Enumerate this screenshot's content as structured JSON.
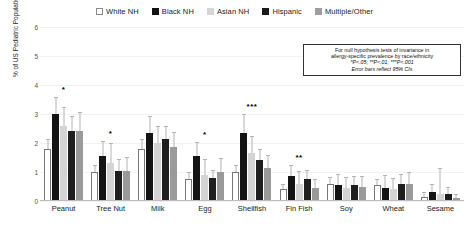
{
  "legend": {
    "position": "top-center",
    "items": [
      {
        "label": "White NH",
        "swatch": "white-swatch",
        "color": "#ffffff"
      },
      {
        "label": "Black NH",
        "swatch": "black-swatch",
        "color": "#141414"
      },
      {
        "label": "Asian NH",
        "swatch": "light-gray-swatch",
        "color": "#d4d4d4"
      },
      {
        "label": "Hispanic",
        "swatch": "dark-swatch",
        "color": "#1f1f1f"
      },
      {
        "label": "Multiple/Other",
        "swatch": "medium-gray-swatch",
        "color": "#9a9a9a"
      }
    ]
  },
  "axes": {
    "ylabel": "% of US Pediatric Population",
    "yticks": [
      "0",
      "1",
      "2",
      "3",
      "4",
      "5",
      "6"
    ]
  },
  "note": {
    "line1": "For null hypothesis tests of invariance in",
    "line2": "allergy-specific prevalence by race/ethnicity",
    "line3": "*P<.05; **P<.01; ***P<.001",
    "line4": "Error bars reflect 95% CIs"
  },
  "chart_data": {
    "type": "bar",
    "title": "",
    "xlabel": "",
    "ylabel": "% of US Pediatric Population",
    "ylim": [
      0,
      6
    ],
    "grid": true,
    "legend_position": "top-center",
    "categories": [
      "Peanut",
      "Tree Nut",
      "Milk",
      "Egg",
      "Shellfish",
      "Fin Fish",
      "Soy",
      "Wheat",
      "Sesame"
    ],
    "significance": [
      "*",
      "*",
      "",
      "*",
      "***",
      "**",
      "",
      "",
      ""
    ],
    "series": [
      {
        "name": "White NH",
        "color": "#ffffff",
        "values": [
          1.8,
          1.0,
          1.8,
          0.75,
          1.0,
          0.4,
          0.6,
          0.55,
          0.15
        ],
        "ci_low": [
          1.55,
          0.82,
          1.55,
          0.6,
          0.82,
          0.28,
          0.44,
          0.4,
          0.07
        ],
        "ci_high": [
          2.1,
          1.22,
          2.1,
          0.95,
          1.2,
          0.55,
          0.78,
          0.72,
          0.26
        ]
      },
      {
        "name": "Black NH",
        "color": "#141414",
        "values": [
          3.0,
          1.55,
          2.35,
          1.55,
          2.35,
          0.85,
          0.55,
          0.45,
          0.3
        ],
        "ci_low": [
          2.6,
          1.2,
          1.95,
          1.2,
          1.95,
          0.62,
          0.34,
          0.26,
          0.14
        ],
        "ci_high": [
          3.55,
          2.05,
          2.9,
          2.0,
          2.95,
          1.2,
          0.9,
          0.85,
          0.55
        ]
      },
      {
        "name": "Asian NH",
        "color": "#d4d4d4",
        "values": [
          2.6,
          1.3,
          2.0,
          0.9,
          1.65,
          0.6,
          0.45,
          0.4,
          0.25
        ],
        "ci_low": [
          2.15,
          0.95,
          1.6,
          0.62,
          1.28,
          0.38,
          0.25,
          0.2,
          0.1
        ],
        "ci_high": [
          3.2,
          1.95,
          2.55,
          1.4,
          2.2,
          1.0,
          0.8,
          0.75,
          1.1
        ]
      },
      {
        "name": "Hispanic",
        "color": "#1f1f1f",
        "values": [
          2.4,
          1.05,
          2.15,
          0.8,
          1.4,
          0.75,
          0.55,
          0.6,
          0.25
        ],
        "ci_low": [
          2.05,
          0.82,
          1.85,
          0.62,
          1.15,
          0.55,
          0.38,
          0.42,
          0.12
        ],
        "ci_high": [
          2.9,
          1.4,
          2.55,
          1.05,
          1.75,
          1.05,
          0.82,
          0.9,
          0.45
        ]
      },
      {
        "name": "Multiple/Other",
        "color": "#9a9a9a",
        "values": [
          2.4,
          1.05,
          1.85,
          1.0,
          1.15,
          0.45,
          0.5,
          0.6,
          0.1
        ],
        "ci_low": [
          1.95,
          0.75,
          1.5,
          0.72,
          0.88,
          0.26,
          0.3,
          0.38,
          0.03
        ],
        "ci_high": [
          3.05,
          1.5,
          2.35,
          1.45,
          1.55,
          0.72,
          0.82,
          0.95,
          0.22
        ]
      }
    ]
  }
}
